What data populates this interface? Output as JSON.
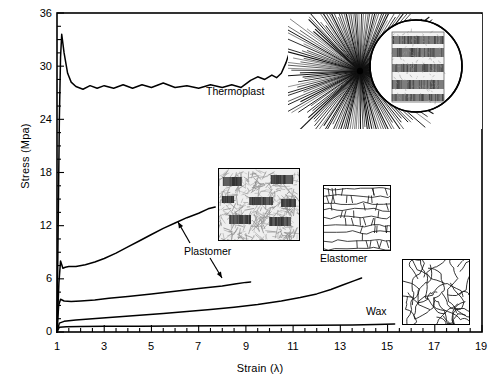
{
  "chart_data": {
    "type": "line",
    "title": "",
    "xlabel": "Strain (λ)",
    "ylabel": "Stress (Mpa)",
    "xlim": [
      1,
      19
    ],
    "ylim": [
      0,
      36
    ],
    "xticks": [
      1,
      3,
      5,
      7,
      9,
      11,
      13,
      15,
      17,
      19
    ],
    "yticks": [
      0,
      6,
      12,
      18,
      24,
      30,
      36
    ],
    "x_minor_step": 0.5,
    "y_minor_step": 1.5,
    "grid": false,
    "legend": "none (inline curve annotations)",
    "line_color": "#000000",
    "series": [
      {
        "name": "Thermoplast",
        "points": [
          [
            1,
            0
          ],
          [
            1.05,
            12
          ],
          [
            1.1,
            24
          ],
          [
            1.15,
            31
          ],
          [
            1.2,
            33.6
          ],
          [
            1.3,
            31.5
          ],
          [
            1.45,
            29.2
          ],
          [
            1.6,
            28.2
          ],
          [
            1.8,
            27.7
          ],
          [
            2.1,
            27.4
          ],
          [
            2.4,
            27.8
          ],
          [
            2.7,
            27.5
          ],
          [
            3.0,
            27.8
          ],
          [
            3.4,
            27.5
          ],
          [
            3.8,
            27.9
          ],
          [
            4.2,
            27.5
          ],
          [
            4.6,
            27.9
          ],
          [
            5.0,
            27.6
          ],
          [
            5.5,
            28.1
          ],
          [
            6.0,
            27.6
          ],
          [
            6.5,
            27.8
          ],
          [
            7.0,
            27.5
          ],
          [
            7.5,
            27.9
          ],
          [
            8.0,
            27.6
          ],
          [
            8.4,
            27.9
          ],
          [
            8.8,
            27.6
          ],
          [
            9.2,
            28.4
          ],
          [
            9.5,
            28.8
          ],
          [
            9.8,
            28.5
          ],
          [
            10.1,
            29.0
          ],
          [
            10.3,
            28.7
          ],
          [
            10.5,
            29.2
          ],
          [
            10.7,
            30.4
          ],
          [
            10.9,
            32.0
          ],
          [
            11.1,
            33.6
          ],
          [
            11.3,
            35.3
          ]
        ]
      },
      {
        "name": "Plastomer (upper)",
        "points": [
          [
            1,
            0
          ],
          [
            1.08,
            5.5
          ],
          [
            1.15,
            8.0
          ],
          [
            1.25,
            7.2
          ],
          [
            1.35,
            7.3
          ],
          [
            1.5,
            7.4
          ],
          [
            1.8,
            7.4
          ],
          [
            2.2,
            7.6
          ],
          [
            2.6,
            7.9
          ],
          [
            3.0,
            8.3
          ],
          [
            3.5,
            8.9
          ],
          [
            4.0,
            9.6
          ],
          [
            4.5,
            10.3
          ],
          [
            5.0,
            11.0
          ],
          [
            5.5,
            11.7
          ],
          [
            6.0,
            12.3
          ],
          [
            6.5,
            12.9
          ],
          [
            7.0,
            13.4
          ],
          [
            7.4,
            13.9
          ],
          [
            7.7,
            14.1
          ]
        ]
      },
      {
        "name": "Plastomer (lower)",
        "points": [
          [
            1,
            0
          ],
          [
            1.07,
            3.0
          ],
          [
            1.15,
            3.7
          ],
          [
            1.3,
            3.5
          ],
          [
            1.6,
            3.45
          ],
          [
            2.0,
            3.5
          ],
          [
            2.6,
            3.6
          ],
          [
            3.2,
            3.8
          ],
          [
            4.0,
            4.0
          ],
          [
            5.0,
            4.3
          ],
          [
            6.0,
            4.6
          ],
          [
            7.0,
            4.9
          ],
          [
            8.0,
            5.2
          ],
          [
            8.6,
            5.45
          ],
          [
            9.0,
            5.6
          ],
          [
            9.2,
            5.65
          ]
        ]
      },
      {
        "name": "Elastomer",
        "points": [
          [
            1,
            0
          ],
          [
            1.1,
            1.0
          ],
          [
            1.3,
            1.2
          ],
          [
            1.8,
            1.35
          ],
          [
            2.5,
            1.5
          ],
          [
            3.5,
            1.7
          ],
          [
            4.5,
            1.9
          ],
          [
            5.5,
            2.1
          ],
          [
            6.5,
            2.3
          ],
          [
            7.5,
            2.55
          ],
          [
            8.5,
            2.8
          ],
          [
            9.5,
            3.1
          ],
          [
            10.5,
            3.5
          ],
          [
            11.3,
            3.9
          ],
          [
            12.0,
            4.3
          ],
          [
            12.6,
            4.8
          ],
          [
            13.1,
            5.3
          ],
          [
            13.6,
            5.8
          ],
          [
            13.9,
            6.1
          ]
        ]
      },
      {
        "name": "Wax",
        "points": [
          [
            1,
            0
          ],
          [
            1.1,
            0.55
          ],
          [
            1.4,
            0.6
          ],
          [
            2.0,
            0.62
          ],
          [
            3.0,
            0.64
          ],
          [
            4.5,
            0.66
          ],
          [
            6.0,
            0.68
          ],
          [
            8.0,
            0.7
          ],
          [
            10.0,
            0.72
          ],
          [
            12.0,
            0.75
          ],
          [
            13.5,
            0.8
          ],
          [
            14.5,
            0.85
          ],
          [
            15.3,
            0.9
          ]
        ]
      }
    ],
    "annotations": [
      {
        "label": "Thermoplast",
        "x_px": 206,
        "y_px": 91,
        "arrow": false
      },
      {
        "label": "Plastomer",
        "x_px": 184,
        "y_px": 250,
        "arrow": true,
        "arrow_count": 2
      },
      {
        "label": "Elastomer",
        "x_px": 320,
        "y_px": 257,
        "arrow": false
      },
      {
        "label": "Wax",
        "x_px": 366,
        "y_px": 310,
        "arrow": false
      }
    ],
    "insets": [
      {
        "name": "thermoplast-spherulite-inset",
        "depicts": "radial spherulite burst with circular magnified lamellar stack"
      },
      {
        "name": "plastomer-lamellae-inset",
        "depicts": "fibrous matrix with dark lamellar blocks"
      },
      {
        "name": "elastomer-network-inset",
        "depicts": "interlocking polygonal cell network"
      },
      {
        "name": "wax-tangle-inset",
        "depicts": "random tangled coiled chains"
      }
    ]
  },
  "axes": {
    "y_title": "Stress (Mpa)",
    "x_title": "Strain (λ)",
    "y_tick_labels": [
      "36",
      "30",
      "24",
      "18",
      "12",
      "6",
      "0"
    ],
    "x_tick_labels": [
      "1",
      "3",
      "5",
      "7",
      "9",
      "11",
      "13",
      "15",
      "17",
      "19"
    ]
  },
  "labels": {
    "thermoplast": "Thermoplast",
    "plastomer": "Plastomer",
    "elastomer": "Elastomer",
    "wax": "Wax"
  }
}
